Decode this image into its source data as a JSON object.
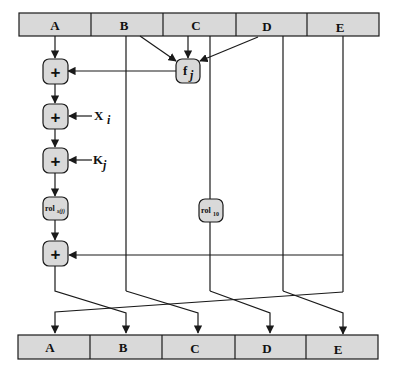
{
  "diagram": {
    "type": "RIPEMD-160 compression step",
    "colors": {
      "box_fill": "#d9d9d9",
      "stroke": "#1a1a1a",
      "background": "#ffffff"
    },
    "top_register": {
      "cells": [
        "A",
        "B",
        "C",
        "D",
        "E"
      ]
    },
    "bottom_register": {
      "cells": [
        "A",
        "B",
        "C",
        "D",
        "E"
      ]
    },
    "operations": {
      "add_symbol": "+",
      "function": {
        "label": "f",
        "subscript": "j"
      },
      "rotate_s": {
        "label": "rol",
        "subscript": "s(j)"
      },
      "rotate_10": {
        "label": "rol",
        "subscript": "10"
      }
    },
    "inputs": {
      "x": {
        "label": "X",
        "subscript": "i"
      },
      "k": {
        "label": "K",
        "subscript": "j"
      }
    }
  }
}
